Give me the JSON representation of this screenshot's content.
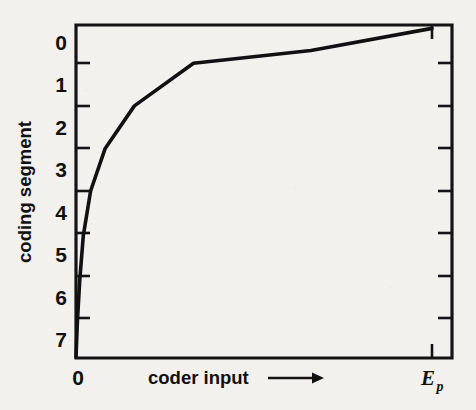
{
  "figure": {
    "name": "companding-characteristic",
    "background_color": "#f2f1ee",
    "ink_color": "#111111"
  },
  "axes": {
    "x": {
      "label": "coder input",
      "label_arrow": "⟶",
      "tick_labels": [
        "0",
        "E"
      ],
      "origin_label": "0",
      "max_label_base": "E",
      "max_label_sub": "p"
    },
    "y": {
      "label": "coding segment",
      "tick_labels": [
        "0",
        "1",
        "2",
        "3",
        "4",
        "5",
        "6",
        "7"
      ]
    }
  },
  "chart_data": {
    "type": "line",
    "title": "",
    "xlabel": "coder input ⟶",
    "ylabel": "coding segment",
    "grid": false,
    "legend": null,
    "x_tick_labels": [
      "0",
      "E_p"
    ],
    "x_tick_values": [
      0,
      1
    ],
    "xlim": [
      0,
      1.053
    ],
    "y_tick_labels": [
      "0",
      "1",
      "2",
      "3",
      "4",
      "5",
      "6",
      "7"
    ],
    "y_tick_values": [
      0,
      1,
      2,
      3,
      4,
      5,
      6,
      7
    ],
    "ylim": [
      7.4,
      -0.4
    ],
    "y_axis_inverted": true,
    "series": [
      {
        "name": "segment boundary characteristic",
        "comment": "piecewise-linear companding curve; x normalised so that x=1 is E_p",
        "x": [
          0.0,
          0.004,
          0.0105,
          0.0205,
          0.041,
          0.082,
          0.164,
          0.33,
          0.66,
          1.0
        ],
        "y": [
          7.4,
          6.55,
          5.6,
          4.55,
          3.5,
          2.5,
          1.5,
          0.5,
          0.2,
          -0.32
        ]
      }
    ],
    "annotations": [
      {
        "text": "0",
        "x": 0.0,
        "y": 7.9,
        "role": "x-origin-tick-label"
      },
      {
        "text": "E_p",
        "x": 1.0,
        "y": 7.9,
        "role": "x-max-tick-label"
      }
    ]
  }
}
